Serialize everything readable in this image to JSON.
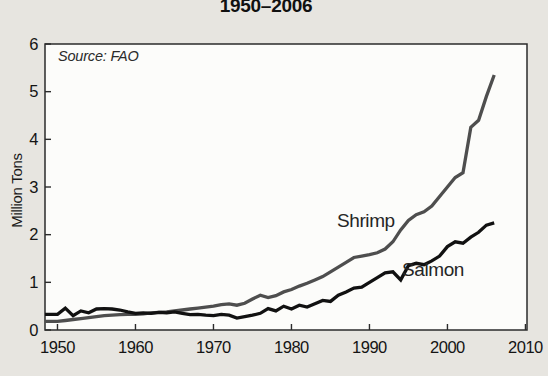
{
  "chart_data": {
    "type": "line",
    "title": "1950–2006",
    "ylabel": "Million Tons",
    "source_note": "Source: FAO",
    "legend": "inline-labels",
    "grid": false,
    "xlim": [
      1948.4,
      2010.2
    ],
    "ylim": [
      0,
      6
    ],
    "x_ticks": [
      1950,
      1960,
      1970,
      1980,
      1990,
      2000,
      2010
    ],
    "y_ticks": [
      0,
      1,
      2,
      3,
      4,
      5,
      6
    ],
    "x": [
      1950,
      1951,
      1952,
      1953,
      1954,
      1955,
      1956,
      1957,
      1958,
      1959,
      1960,
      1961,
      1962,
      1963,
      1964,
      1965,
      1966,
      1967,
      1968,
      1969,
      1970,
      1971,
      1972,
      1973,
      1974,
      1975,
      1976,
      1977,
      1978,
      1979,
      1980,
      1981,
      1982,
      1983,
      1984,
      1985,
      1986,
      1987,
      1988,
      1989,
      1990,
      1991,
      1992,
      1993,
      1994,
      1995,
      1996,
      1997,
      1998,
      1999,
      2000,
      2001,
      2002,
      2003,
      2004,
      2005,
      2006
    ],
    "series": [
      {
        "name": "Shrimp",
        "color": "#4e4e4e",
        "values": [
          0.18,
          0.2,
          0.22,
          0.24,
          0.26,
          0.28,
          0.3,
          0.31,
          0.32,
          0.33,
          0.33,
          0.34,
          0.36,
          0.37,
          0.38,
          0.4,
          0.42,
          0.44,
          0.46,
          0.48,
          0.5,
          0.53,
          0.55,
          0.52,
          0.56,
          0.65,
          0.73,
          0.68,
          0.72,
          0.8,
          0.85,
          0.92,
          0.98,
          1.05,
          1.12,
          1.22,
          1.32,
          1.42,
          1.52,
          1.55,
          1.58,
          1.62,
          1.7,
          1.85,
          2.1,
          2.3,
          2.42,
          2.48,
          2.6,
          2.8,
          3.0,
          3.2,
          3.3,
          4.25,
          4.4,
          4.9,
          5.35
        ]
      },
      {
        "name": "Salmon",
        "color": "#111111",
        "values": [
          0.33,
          0.46,
          0.3,
          0.4,
          0.36,
          0.44,
          0.45,
          0.44,
          0.42,
          0.38,
          0.35,
          0.36,
          0.35,
          0.37,
          0.36,
          0.38,
          0.35,
          0.32,
          0.33,
          0.31,
          0.3,
          0.33,
          0.31,
          0.25,
          0.28,
          0.31,
          0.35,
          0.45,
          0.4,
          0.5,
          0.44,
          0.52,
          0.48,
          0.55,
          0.62,
          0.6,
          0.73,
          0.8,
          0.88,
          0.9,
          1.0,
          1.1,
          1.2,
          1.22,
          1.05,
          1.35,
          1.4,
          1.37,
          1.45,
          1.55,
          1.75,
          1.85,
          1.82,
          1.95,
          2.05,
          2.2,
          2.25
        ]
      }
    ],
    "colors": {
      "page_bg": "#e7e5e0",
      "plot_bg": "#fcfcfa",
      "frame": "#2b2b2b"
    }
  }
}
